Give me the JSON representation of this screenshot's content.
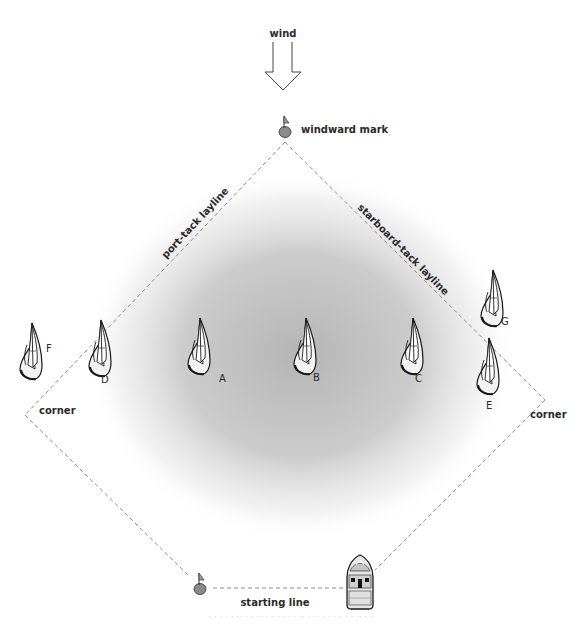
{
  "diagram": {
    "wind": {
      "label": "wind",
      "icon": "wind-arrow-icon",
      "direction": "down"
    },
    "marks": {
      "windward": {
        "label": "windward mark",
        "x": 285,
        "y": 128,
        "color": "#8a8a8a"
      },
      "pin": {
        "x": 200,
        "y": 585,
        "color": "#8a8a8a"
      },
      "committee_boat": {
        "x": 360,
        "y": 582
      }
    },
    "laylines": {
      "port": "port-tack layline",
      "starboard": "starboard-tack layline"
    },
    "corners": {
      "left": "corner",
      "right": "corner"
    },
    "starting_line": {
      "label": "starting line"
    },
    "boats": [
      {
        "id": "F",
        "x": 32,
        "y": 355,
        "label_dx": 14,
        "label_dy": -3
      },
      {
        "id": "D",
        "x": 97,
        "y": 357,
        "label_dx": 4,
        "label_dy": 26
      },
      {
        "id": "A",
        "x": 203,
        "y": 352,
        "label_dx": 16,
        "label_dy": 30
      },
      {
        "id": "B",
        "x": 308,
        "y": 350,
        "label_dx": 7,
        "label_dy": 31
      },
      {
        "id": "C",
        "x": 414,
        "y": 350,
        "label_dx": 7,
        "label_dy": 31
      },
      {
        "id": "G",
        "x": 490,
        "y": 300,
        "label_dx": 10,
        "label_dy": 22
      },
      {
        "id": "E",
        "x": 492,
        "y": 368,
        "label_dx": 2,
        "label_dy": 40
      }
    ],
    "shading": {
      "color": "#bdbdbd",
      "label": ""
    },
    "colors": {
      "line": "#8c8c8c",
      "text": "#2a2a2a",
      "boat_fill": "#f2f2f2",
      "boat_stroke": "#1a1a1a"
    },
    "caption": "· · ·  ·  · ·· · ·  ·· ·  · ·  · · ·  ·· ·  ·· ·  · · ·  · · ·· · ·"
  }
}
